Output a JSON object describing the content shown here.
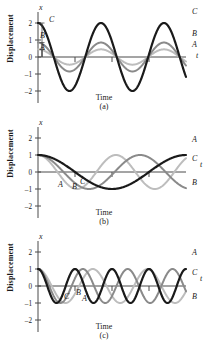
{
  "figure": {
    "axis_y_title": "Displacement",
    "axis_x_title": "Time",
    "axis_x_symbol": "t",
    "axis_y_symbol": "x",
    "y_ticks": [
      "2",
      "1",
      "0",
      "–1",
      "–2"
    ],
    "colors": {
      "curve_black": "#1a1a1a",
      "curve_mid_gray": "#8a8a8a",
      "curve_light_gray": "#bdbdbd",
      "axis": "#4a4a4a",
      "text": "#1a1a1a",
      "background": "#ffffff"
    },
    "panels": [
      {
        "id": "a",
        "caption": "(a)",
        "inner_labels": [
          {
            "text": "C",
            "x": 49,
            "y": 22
          },
          {
            "text": "B",
            "x": 40,
            "y": 38
          },
          {
            "text": "A",
            "x": 40,
            "y": 50
          }
        ],
        "right_labels": [
          {
            "text": "C",
            "x": 192,
            "y": 14
          },
          {
            "text": "B",
            "x": 192,
            "y": 36
          },
          {
            "text": "A",
            "x": 192,
            "y": 47
          },
          {
            "text": "t",
            "x": 196,
            "y": 58
          }
        ]
      },
      {
        "id": "b",
        "caption": "(b)",
        "inner_labels": [
          {
            "text": "A",
            "x": 58,
            "y": 72
          },
          {
            "text": "B",
            "x": 72,
            "y": 74
          },
          {
            "text": "C",
            "x": 80,
            "y": 69
          }
        ],
        "right_labels": [
          {
            "text": "A",
            "x": 192,
            "y": 27
          },
          {
            "text": "C",
            "x": 192,
            "y": 46
          },
          {
            "text": "t",
            "x": 200,
            "y": 52
          },
          {
            "text": "B",
            "x": 192,
            "y": 70
          }
        ]
      },
      {
        "id": "c",
        "caption": "(c)",
        "inner_labels": [
          {
            "text": "C",
            "x": 64,
            "y": 70
          },
          {
            "text": "B",
            "x": 76,
            "y": 66
          },
          {
            "text": "A",
            "x": 82,
            "y": 72
          }
        ],
        "right_labels": [
          {
            "text": "A",
            "x": 192,
            "y": 26
          },
          {
            "text": "C",
            "x": 192,
            "y": 46
          },
          {
            "text": "t",
            "x": 200,
            "y": 52
          },
          {
            "text": "B",
            "x": 192,
            "y": 70
          }
        ]
      }
    ]
  },
  "chart_data": [
    {
      "type": "line",
      "title": "(a)",
      "xlabel": "Time",
      "ylabel": "Displacement",
      "ylim": [
        -2.4,
        2.4
      ],
      "xlim": [
        0,
        2.35
      ],
      "yticks": [
        2,
        1,
        0,
        -1,
        -2
      ],
      "grid": false,
      "legend": "inline-curve-labels",
      "description": "Three cosine waves of equal period but different amplitudes.",
      "series": [
        {
          "name": "A",
          "color": "#bdbdbd",
          "amplitude": 0.45,
          "periods": 2.35,
          "phase_deg": 0,
          "form": "x = 0.45 cos(2πt)"
        },
        {
          "name": "B",
          "color": "#8a8a8a",
          "amplitude": 0.85,
          "periods": 2.35,
          "phase_deg": 0,
          "form": "x = 0.85 cos(2πt)"
        },
        {
          "name": "C",
          "color": "#1a1a1a",
          "amplitude": 2.0,
          "periods": 2.35,
          "phase_deg": 0,
          "form": "x = 2.0 cos(2πt)"
        }
      ]
    },
    {
      "type": "line",
      "title": "(b)",
      "xlabel": "Time",
      "ylabel": "Displacement",
      "ylim": [
        -2.4,
        2.4
      ],
      "xlim": [
        0,
        2.35
      ],
      "yticks": [
        2,
        1,
        0,
        -1,
        -2
      ],
      "grid": false,
      "legend": "inline-curve-labels",
      "description": "Three cosine waves of equal amplitude 1 but different frequencies; A lowest frequency, B highest.",
      "series": [
        {
          "name": "A",
          "color": "#1a1a1a",
          "amplitude": 1.0,
          "cycles": 1.0,
          "phase_deg": 0,
          "form": "x = cos(2πt/T)"
        },
        {
          "name": "C",
          "color": "#8a8a8a",
          "amplitude": 1.0,
          "cycles": 1.45,
          "phase_deg": 0,
          "form": "x = cos(2.9πt/T)"
        },
        {
          "name": "B",
          "color": "#bdbdbd",
          "amplitude": 1.0,
          "cycles": 1.9,
          "phase_deg": 0,
          "form": "x = cos(3.8πt/T)"
        }
      ]
    },
    {
      "type": "line",
      "title": "(c)",
      "xlabel": "Time",
      "ylabel": "Displacement",
      "ylim": [
        -2.4,
        2.4
      ],
      "xlim": [
        0,
        2.35
      ],
      "yticks": [
        2,
        1,
        0,
        -1,
        -2
      ],
      "grid": false,
      "legend": "inline-curve-labels",
      "description": "Three cosine waves of equal amplitude 1 at higher frequencies; A highest frequency, B lowest.",
      "series": [
        {
          "name": "A",
          "color": "#1a1a1a",
          "amplitude": 1.0,
          "cycles": 4.0,
          "phase_deg": 0,
          "form": "x = cos(8πt/T)"
        },
        {
          "name": "C",
          "color": "#8a8a8a",
          "amplitude": 1.0,
          "cycles": 3.3,
          "phase_deg": 0,
          "form": "x = cos(6.6πt/T)"
        },
        {
          "name": "B",
          "color": "#bdbdbd",
          "amplitude": 1.0,
          "cycles": 2.7,
          "phase_deg": 0,
          "form": "x = cos(5.4πt/T)"
        }
      ]
    }
  ]
}
